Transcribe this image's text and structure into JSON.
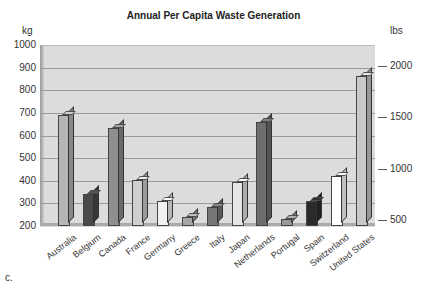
{
  "chart_data": {
    "type": "bar",
    "title": "Annual Per Capita Waste Generation",
    "xlabel": "",
    "ylabel": "kg",
    "y2label": "lbs",
    "ylim": [
      200,
      1000
    ],
    "yticks": [
      200,
      300,
      400,
      500,
      600,
      700,
      800,
      900,
      1000
    ],
    "y2ticks": [
      500,
      1000,
      1500,
      2000
    ],
    "grid": true,
    "categories": [
      "Australia",
      "Belgium",
      "Canada",
      "France",
      "Germany",
      "Greece",
      "Italy",
      "Japan",
      "Netherlands",
      "Portugal",
      "Spain",
      "Switzerland",
      "United States"
    ],
    "values": [
      690,
      340,
      635,
      405,
      310,
      240,
      285,
      395,
      660,
      230,
      310,
      420,
      865
    ],
    "colors": [
      "#b5b5b5",
      "#4a4a4a",
      "#8f8f8f",
      "#cfcfcf",
      "#f2f2f2",
      "#a5a5a5",
      "#777777",
      "#e6e6e6",
      "#6e6e6e",
      "#9a9a9a",
      "#2a2a2a",
      "#ffffff",
      "#c8c8c8"
    ],
    "annotation": "c."
  }
}
